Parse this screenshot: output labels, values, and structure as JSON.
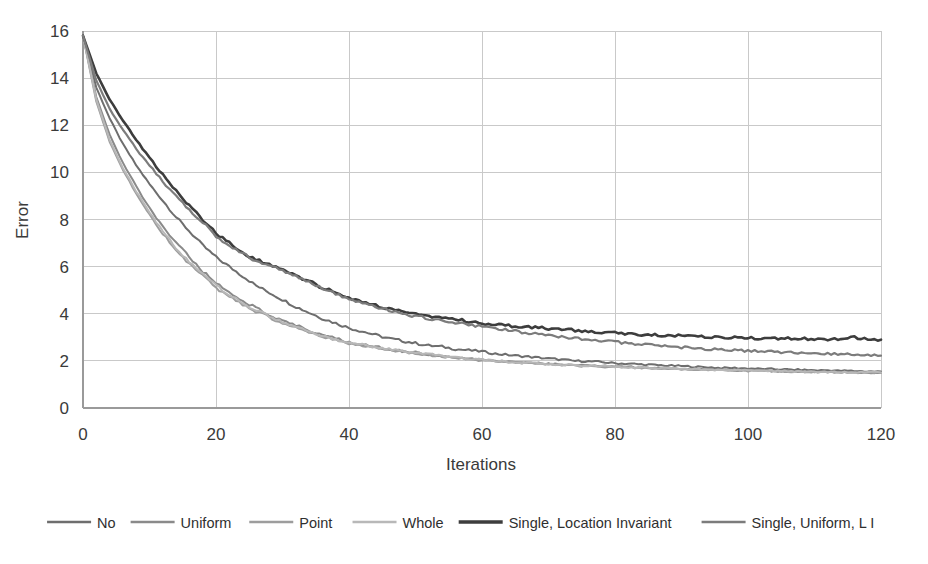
{
  "chart_data": {
    "type": "line",
    "title": "",
    "xlabel": "Iterations",
    "ylabel": "Error",
    "xlim": [
      0,
      120
    ],
    "ylim": [
      0,
      16
    ],
    "xticks": [
      0,
      20,
      40,
      60,
      80,
      100,
      120
    ],
    "yticks": [
      0,
      2,
      4,
      6,
      8,
      10,
      12,
      14,
      16
    ],
    "grid": true,
    "legend_position": "bottom",
    "x": [
      0,
      2,
      4,
      6,
      8,
      10,
      12,
      14,
      16,
      18,
      20,
      22,
      24,
      26,
      28,
      30,
      32,
      34,
      36,
      38,
      40,
      42,
      44,
      46,
      48,
      50,
      52,
      54,
      56,
      58,
      60,
      62,
      64,
      66,
      68,
      70,
      72,
      74,
      76,
      78,
      80,
      82,
      84,
      86,
      88,
      90,
      92,
      94,
      96,
      98,
      100,
      102,
      104,
      106,
      108,
      110,
      112,
      114,
      116,
      118,
      120
    ],
    "series": [
      {
        "name": "No",
        "color": "#6e6e6e",
        "width": 2.0,
        "values": [
          15.8,
          13.6,
          12.3,
          11.2,
          10.3,
          9.5,
          8.8,
          8.1,
          7.5,
          6.9,
          6.4,
          6.0,
          5.6,
          5.2,
          4.9,
          4.6,
          4.3,
          4.05,
          3.8,
          3.6,
          3.4,
          3.25,
          3.1,
          2.95,
          2.85,
          2.75,
          2.65,
          2.6,
          2.5,
          2.45,
          2.4,
          2.3,
          2.25,
          2.2,
          2.15,
          2.1,
          2.05,
          2.0,
          1.98,
          1.95,
          1.9,
          1.88,
          1.85,
          1.82,
          1.8,
          1.78,
          1.75,
          1.73,
          1.7,
          1.7,
          1.68,
          1.66,
          1.65,
          1.63,
          1.62,
          1.6,
          1.6,
          1.58,
          1.57,
          1.55,
          1.55
        ]
      },
      {
        "name": "Uniform",
        "color": "#8a8a8a",
        "width": 2.0,
        "values": [
          15.8,
          13.2,
          11.6,
          10.4,
          9.4,
          8.5,
          7.7,
          7.0,
          6.4,
          5.8,
          5.3,
          4.9,
          4.55,
          4.25,
          3.95,
          3.7,
          3.5,
          3.3,
          3.1,
          2.95,
          2.8,
          2.7,
          2.6,
          2.5,
          2.42,
          2.35,
          2.28,
          2.2,
          2.15,
          2.1,
          2.05,
          2.0,
          1.97,
          1.94,
          1.9,
          1.88,
          1.85,
          1.82,
          1.8,
          1.78,
          1.76,
          1.74,
          1.72,
          1.7,
          1.68,
          1.66,
          1.65,
          1.63,
          1.62,
          1.6,
          1.6,
          1.58,
          1.57,
          1.56,
          1.55,
          1.54,
          1.53,
          1.52,
          1.52,
          1.5,
          1.5
        ]
      },
      {
        "name": "Point",
        "color": "#9d9d9d",
        "width": 2.0,
        "values": [
          15.8,
          13.0,
          11.3,
          10.1,
          9.1,
          8.2,
          7.4,
          6.7,
          6.1,
          5.6,
          5.1,
          4.7,
          4.4,
          4.1,
          3.85,
          3.6,
          3.4,
          3.2,
          3.0,
          2.88,
          2.75,
          2.65,
          2.55,
          2.48,
          2.4,
          2.32,
          2.25,
          2.2,
          2.12,
          2.08,
          2.02,
          1.98,
          1.95,
          1.92,
          1.89,
          1.86,
          1.83,
          1.8,
          1.78,
          1.76,
          1.74,
          1.72,
          1.7,
          1.68,
          1.67,
          1.65,
          1.64,
          1.62,
          1.61,
          1.6,
          1.58,
          1.57,
          1.56,
          1.55,
          1.54,
          1.53,
          1.53,
          1.52,
          1.51,
          1.5,
          1.5
        ]
      },
      {
        "name": "Whole",
        "color": "#b8b8b8",
        "width": 2.0,
        "values": [
          15.8,
          13.1,
          11.4,
          10.2,
          9.2,
          8.3,
          7.5,
          6.8,
          6.2,
          5.7,
          5.2,
          4.8,
          4.45,
          4.15,
          3.9,
          3.65,
          3.45,
          3.25,
          3.05,
          2.9,
          2.78,
          2.68,
          2.58,
          2.5,
          2.42,
          2.34,
          2.27,
          2.21,
          2.14,
          2.09,
          2.04,
          2.0,
          1.96,
          1.93,
          1.9,
          1.87,
          1.84,
          1.82,
          1.79,
          1.77,
          1.75,
          1.73,
          1.71,
          1.69,
          1.68,
          1.66,
          1.65,
          1.63,
          1.62,
          1.61,
          1.6,
          1.58,
          1.57,
          1.56,
          1.55,
          1.54,
          1.54,
          1.53,
          1.52,
          1.52,
          1.51
        ]
      },
      {
        "name": "Single, Location Invariant",
        "color": "#3d3d3d",
        "width": 2.6,
        "values": [
          15.8,
          14.2,
          13.1,
          12.2,
          11.4,
          10.6,
          9.9,
          9.2,
          8.6,
          8.0,
          7.4,
          7.0,
          6.6,
          6.3,
          6.1,
          5.9,
          5.6,
          5.4,
          5.1,
          4.9,
          4.7,
          4.5,
          4.35,
          4.2,
          4.1,
          4.0,
          3.9,
          3.82,
          3.75,
          3.68,
          3.6,
          3.55,
          3.5,
          3.46,
          3.42,
          3.38,
          3.35,
          3.3,
          3.26,
          3.22,
          3.18,
          3.15,
          3.12,
          3.1,
          3.08,
          3.05,
          3.02,
          3.0,
          3.0,
          2.98,
          2.97,
          2.96,
          2.95,
          2.95,
          2.94,
          2.94,
          2.93,
          2.95,
          3.0,
          2.93,
          2.9
        ]
      },
      {
        "name": "Single, Uniform, L I",
        "color": "#7c7c7c",
        "width": 2.2,
        "values": [
          15.8,
          13.9,
          12.7,
          11.8,
          11.0,
          10.3,
          9.6,
          9.0,
          8.4,
          7.9,
          7.3,
          6.9,
          6.55,
          6.25,
          6.05,
          5.85,
          5.6,
          5.35,
          5.1,
          4.85,
          4.65,
          4.45,
          4.3,
          4.15,
          4.0,
          3.9,
          3.8,
          3.7,
          3.62,
          3.55,
          3.45,
          3.38,
          3.3,
          3.22,
          3.15,
          3.08,
          3.0,
          2.95,
          2.9,
          2.85,
          2.8,
          2.75,
          2.7,
          2.66,
          2.62,
          2.58,
          2.54,
          2.5,
          2.48,
          2.45,
          2.42,
          2.4,
          2.38,
          2.36,
          2.34,
          2.32,
          2.3,
          2.28,
          2.26,
          2.24,
          2.22
        ]
      }
    ]
  },
  "axes": {
    "y_title": "Error",
    "x_title": "Iterations",
    "y_tick_labels": [
      "16",
      "14",
      "12",
      "10",
      "8",
      "6",
      "4",
      "2",
      "0"
    ],
    "x_tick_labels": [
      "0",
      "20",
      "40",
      "60",
      "80",
      "100",
      "120"
    ]
  },
  "legend": {
    "items": [
      {
        "label": "No",
        "color": "#6e6e6e",
        "width": 2.4
      },
      {
        "label": "Uniform",
        "color": "#8a8a8a",
        "width": 2.4
      },
      {
        "label": "Point",
        "color": "#9d9d9d",
        "width": 2.4
      },
      {
        "label": "Whole",
        "color": "#b8b8b8",
        "width": 2.4
      },
      {
        "label": "Single, Location Invariant",
        "color": "#3d3d3d",
        "width": 3.4
      },
      {
        "label": "Single, Uniform, L I",
        "color": "#7c7c7c",
        "width": 2.4
      }
    ]
  }
}
